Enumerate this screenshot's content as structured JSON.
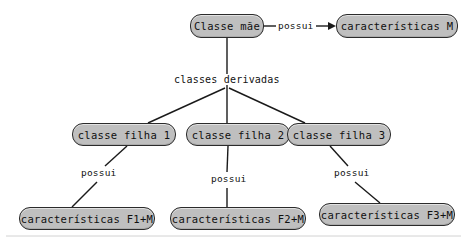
{
  "diagram": {
    "type": "class-inheritance-diagram",
    "language": "pt-BR",
    "background_color": "#ffffff",
    "node_fill_color": "#bfbfbf",
    "node_border_color": "#2b2b2b",
    "line_color": "#1a1a1a",
    "nodes": {
      "root": "Classe mãe",
      "feature_m": "características M",
      "child_1": "classe filha 1",
      "child_2": "classe filha 2",
      "child_3": "classe filha 3",
      "feature_f1": "características F1+M",
      "feature_f2": "características F2+M",
      "feature_f3": "características F3+M"
    },
    "edge_labels": {
      "possui_root": "possui",
      "classes_derivadas": "classes derivadas",
      "possui_1": "possui",
      "possui_2": "possui",
      "possui_3": "possui"
    }
  }
}
